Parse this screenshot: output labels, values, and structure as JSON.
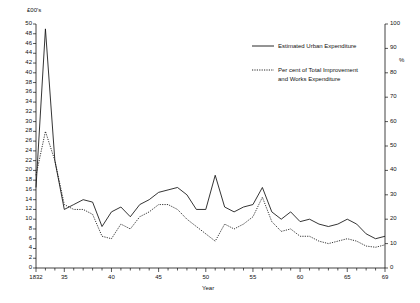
{
  "chart_data": {
    "type": "line",
    "title": "",
    "xlabel": "Year",
    "ylabel": "£00's",
    "ylabel_right": "%",
    "ylim": [
      0,
      50
    ],
    "ylim_right": [
      0,
      100
    ],
    "xlim": [
      1832,
      1869
    ],
    "grid": false,
    "legend_position": "top-right",
    "yticks": [
      0,
      2,
      4,
      6,
      8,
      10,
      12,
      14,
      16,
      18,
      20,
      22,
      24,
      26,
      28,
      30,
      32,
      34,
      36,
      38,
      40,
      42,
      44,
      46,
      48,
      50
    ],
    "yticks_right": [
      0,
      10,
      20,
      30,
      40,
      50,
      60,
      70,
      80,
      90,
      100
    ],
    "xticks_major": [
      1832,
      1835,
      1840,
      1845,
      1850,
      1855,
      1860,
      1865,
      1869
    ],
    "xtick_labels": [
      "1832",
      "35",
      "40",
      "45",
      "50",
      "55",
      "60",
      "65",
      "69"
    ],
    "x": [
      1832,
      1833,
      1834,
      1835,
      1836,
      1837,
      1838,
      1839,
      1840,
      1841,
      1842,
      1843,
      1844,
      1845,
      1846,
      1847,
      1848,
      1849,
      1850,
      1851,
      1852,
      1853,
      1854,
      1855,
      1856,
      1857,
      1858,
      1859,
      1860,
      1861,
      1862,
      1863,
      1864,
      1865,
      1866,
      1867,
      1868,
      1869
    ],
    "series": [
      {
        "name": "Estimated Urban Expenditure",
        "style": "solid",
        "axis": "left",
        "units": "£00's",
        "values": [
          16.5,
          49.0,
          22.0,
          12.0,
          13.0,
          14.0,
          13.5,
          8.5,
          11.5,
          12.5,
          10.5,
          13.0,
          14.0,
          15.5,
          16.0,
          16.5,
          15.0,
          12.0,
          12.0,
          19.0,
          12.5,
          11.5,
          12.5,
          13.0,
          16.5,
          11.5,
          10.0,
          11.5,
          9.5,
          10.0,
          9.0,
          8.5,
          9.0,
          10.0,
          9.0,
          7.0,
          6.0,
          6.5
        ]
      },
      {
        "name": "Per cent of Total Improvement and Works Expenditure",
        "style": "dotted",
        "axis": "right",
        "units": "%",
        "values": [
          38.0,
          56.0,
          44.0,
          26.0,
          24.0,
          24.0,
          22.0,
          13.0,
          12.0,
          18.0,
          16.0,
          21.0,
          23.0,
          26.0,
          26.0,
          24.0,
          20.0,
          17.0,
          14.0,
          11.0,
          18.0,
          16.0,
          18.0,
          21.0,
          29.0,
          19.0,
          15.0,
          16.0,
          13.0,
          13.0,
          11.0,
          10.0,
          11.0,
          12.0,
          11.0,
          9.0,
          8.5,
          9.5
        ]
      }
    ]
  },
  "legend": {
    "entry1": "Estimated Urban Expenditure",
    "entry2_line1": "Per cent of Total Improvement",
    "entry2_line2": "and Works Expenditure"
  },
  "axes": {
    "left_title": "£00's",
    "right_title": "%",
    "x_title": "Year"
  }
}
